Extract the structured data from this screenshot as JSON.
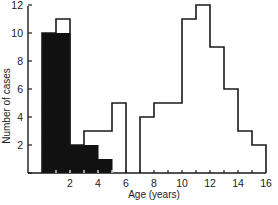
{
  "chart_data": {
    "type": "bar",
    "title": "",
    "xlabel": "Age (years)",
    "ylabel": "Number of cases",
    "xlim": [
      0,
      16
    ],
    "ylim": [
      0,
      12
    ],
    "grid": false,
    "legend": null,
    "bin_width": 1,
    "categories": [
      "0-1",
      "1-2",
      "2-3",
      "3-4",
      "4-5",
      "5-6",
      "6-7",
      "7-8",
      "8-9",
      "9-10",
      "10-11",
      "11-12",
      "12-13",
      "13-14",
      "14-15",
      "15-16"
    ],
    "x_ticks": [
      2,
      4,
      6,
      8,
      10,
      12,
      14,
      16
    ],
    "y_ticks": [
      2,
      4,
      6,
      8,
      10,
      12
    ],
    "series": [
      {
        "name": "Total (outline)",
        "style": "outline",
        "color": "#1a1a1a",
        "values": [
          10,
          11,
          2,
          3,
          3,
          5,
          0,
          4,
          5,
          5,
          11,
          12,
          9,
          6,
          3,
          2
        ]
      },
      {
        "name": "Subset (filled)",
        "style": "filled",
        "color": "#111111",
        "values": [
          10,
          10,
          2,
          2,
          1,
          0,
          0,
          0,
          0,
          0,
          0,
          0,
          0,
          0,
          0,
          0
        ]
      }
    ]
  },
  "axes": {
    "x_label": "Age (years)",
    "y_label": "Number of cases",
    "x_tick_labels": [
      "2",
      "4",
      "6",
      "8",
      "10",
      "12",
      "14",
      "16"
    ],
    "y_tick_labels": [
      "2",
      "4",
      "6",
      "8",
      "10",
      "12"
    ]
  }
}
